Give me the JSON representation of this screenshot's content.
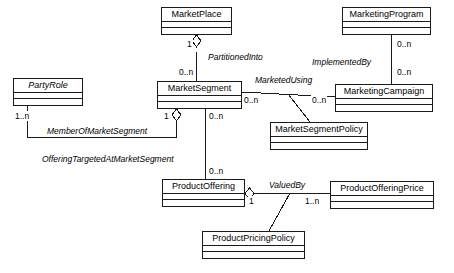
{
  "diagram": {
    "type": "uml-class-diagram",
    "stroke_color": "#1a1a1a",
    "background_color": "#ffffff",
    "classes": [
      {
        "id": "marketplace",
        "name": "MarketPlace",
        "abstract": false,
        "x": 161,
        "y": 7,
        "w": 71,
        "h": 28
      },
      {
        "id": "marketingprogram",
        "name": "MarketingProgram",
        "abstract": false,
        "x": 342,
        "y": 7,
        "w": 89,
        "h": 28
      },
      {
        "id": "partyrole",
        "name": "PartyRole",
        "abstract": true,
        "x": 13,
        "y": 78,
        "w": 70,
        "h": 28
      },
      {
        "id": "marketsegment",
        "name": "MarketSegment",
        "abstract": false,
        "x": 157,
        "y": 81,
        "w": 85,
        "h": 28
      },
      {
        "id": "marketingcampaign",
        "name": "MarketingCampaign",
        "abstract": false,
        "x": 335,
        "y": 84,
        "w": 98,
        "h": 28
      },
      {
        "id": "marketsegmentpolicy",
        "name": "MarketSegmentPolicy",
        "abstract": false,
        "x": 270,
        "y": 122,
        "w": 98,
        "h": 28
      },
      {
        "id": "productoffering",
        "name": "ProductOffering",
        "abstract": false,
        "x": 162,
        "y": 179,
        "w": 83,
        "h": 28
      },
      {
        "id": "productofferingprice",
        "name": "ProductOfferingPrice",
        "abstract": false,
        "x": 330,
        "y": 181,
        "w": 104,
        "h": 28
      },
      {
        "id": "productpricingpolicy",
        "name": "ProductPricingPolicy",
        "abstract": false,
        "x": 202,
        "y": 231,
        "w": 103,
        "h": 28
      }
    ],
    "associations": [
      {
        "id": "partitioned-into",
        "label": "PartitionedInto",
        "from": "marketplace",
        "to": "marketsegment",
        "from_multiplicity": "1",
        "to_multiplicity": "0..n",
        "aggregation": true
      },
      {
        "id": "implemented-by",
        "label": "ImplementedBy",
        "from": "marketingprogram",
        "to": "marketingcampaign",
        "from_multiplicity": "0..n",
        "to_multiplicity": "0..n",
        "aggregation": false
      },
      {
        "id": "marketed-using",
        "label": "MarketedUsing",
        "from": "marketsegment",
        "to": "marketingcampaign",
        "from_multiplicity": "0..n",
        "to_multiplicity": "0..n",
        "aggregation": false,
        "policy": "marketsegmentpolicy"
      },
      {
        "id": "member-of-market-segment",
        "label": "MemberOfMarketSegment",
        "from": "partyrole",
        "to": "marketsegment",
        "from_multiplicity": "1..n",
        "to_multiplicity": "1",
        "aggregation": true
      },
      {
        "id": "offering-targeted-at-market-segment",
        "label": "OfferingTargetedAtMarketSegment",
        "from": "marketsegment",
        "to": "productoffering",
        "from_multiplicity": "0..n",
        "to_multiplicity": "0..n",
        "aggregation": false
      },
      {
        "id": "valued-by",
        "label": "ValuedBy",
        "from": "productoffering",
        "to": "productofferingprice",
        "from_multiplicity": "1",
        "to_multiplicity": "1..n",
        "aggregation": true,
        "policy": "productpricingpolicy"
      }
    ],
    "labels": {
      "partitioned_into": {
        "text": "PartitionedInto",
        "x": 207,
        "y": 52
      },
      "implemented_by": {
        "text": "ImplementedBy",
        "x": 311,
        "y": 57
      },
      "marketed_using": {
        "text": "MarketedUsing",
        "x": 254,
        "y": 75
      },
      "member_of_market_segment": {
        "text": "MemberOfMarketSegment",
        "x": 46,
        "y": 126
      },
      "offering_targeted": {
        "text": "OfferingTargetedAtMarketSegment",
        "x": 41,
        "y": 154
      },
      "valued_by": {
        "text": "ValuedBy",
        "x": 268,
        "y": 180
      }
    },
    "multiplicities": {
      "mp_to_ms_top": {
        "text": "1",
        "x": 186,
        "y": 40
      },
      "mp_to_ms_bottom": {
        "text": "0..n",
        "x": 180,
        "y": 68
      },
      "mprog_to_mcamp_top": {
        "text": "0..n",
        "x": 399,
        "y": 40
      },
      "mprog_to_mcamp_bottom": {
        "text": "0..n",
        "x": 399,
        "y": 68
      },
      "ms_to_mcamp_left": {
        "text": "0..n",
        "x": 243,
        "y": 95
      },
      "ms_to_mcamp_right": {
        "text": "0..n",
        "x": 311,
        "y": 95
      },
      "pr_to_ms_left": {
        "text": "1..n",
        "x": 14,
        "y": 112
      },
      "pr_to_ms_right": {
        "text": "1",
        "x": 163,
        "y": 112
      },
      "ms_to_po_top": {
        "text": "0..n",
        "x": 209,
        "y": 112
      },
      "ms_to_po_bottom": {
        "text": "0..n",
        "x": 209,
        "y": 167
      },
      "po_to_pop_left": {
        "text": "1",
        "x": 249,
        "y": 195
      },
      "po_to_pop_right": {
        "text": "1..n",
        "x": 305,
        "y": 195
      }
    }
  }
}
